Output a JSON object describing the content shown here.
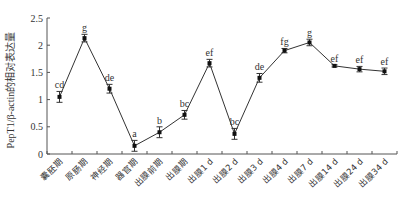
{
  "chart_data": {
    "type": "line",
    "title": "",
    "xlabel": "",
    "ylabel": "PepT1/β-actin的相对表达量",
    "ylim": [
      0,
      2.5
    ],
    "yticks": [
      0,
      0.5,
      1,
      1.5,
      2,
      2.5
    ],
    "ytick_labels": [
      "0",
      "0.5",
      "1",
      "1.5",
      "2",
      "2.5"
    ],
    "grid": false,
    "legend": null,
    "categories": [
      "囊胚期",
      "原肠期",
      "神经期",
      "器官期",
      "出膜前期",
      "出膜期",
      "出膜1 d",
      "出膜2 d",
      "出膜3 d",
      "出膜4 d",
      "出膜7 d",
      "出膜14 d",
      "出膜24 d",
      "出膜34 d"
    ],
    "series": [
      {
        "name": "PepT1 relative expression",
        "values": [
          1.05,
          2.13,
          1.2,
          0.15,
          0.4,
          0.72,
          1.67,
          0.37,
          1.4,
          1.9,
          2.05,
          1.62,
          1.56,
          1.52
        ],
        "errors": [
          0.1,
          0.07,
          0.08,
          0.1,
          0.1,
          0.08,
          0.07,
          0.1,
          0.08,
          0.04,
          0.06,
          0.02,
          0.05,
          0.06
        ],
        "significance": [
          "cd",
          "g",
          "de",
          "a",
          "b",
          "bc",
          "ef",
          "bc",
          "de",
          "fg",
          "g",
          "ef",
          "ef",
          "ef"
        ]
      }
    ]
  },
  "colors": {
    "line": "#333333",
    "axis": "#555555",
    "background": "#ffffff"
  }
}
